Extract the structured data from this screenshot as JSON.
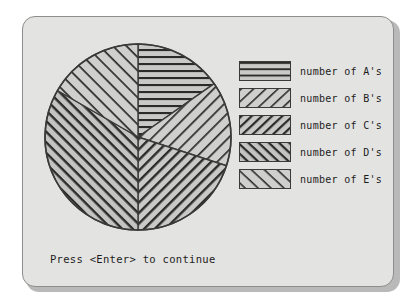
{
  "panel": {
    "background_color": "#e3e3e1",
    "border_color": "#8d8d8d"
  },
  "prompt": {
    "text": "Press <Enter> to continue"
  },
  "legend": {
    "items": [
      {
        "label": "number of A's",
        "pattern": "horizontal-lines",
        "key": "A"
      },
      {
        "label": "number of B's",
        "pattern": "forward-diagonal-sparse",
        "key": "B"
      },
      {
        "label": "number of C's",
        "pattern": "forward-diagonal-dense",
        "key": "C"
      },
      {
        "label": "number of D's",
        "pattern": "back-diagonal-dense",
        "key": "D"
      },
      {
        "label": "number of E's",
        "pattern": "back-diagonal-sparse",
        "key": "E"
      }
    ]
  },
  "chart_data": {
    "type": "pie",
    "title": "",
    "start_angle_deg": 0,
    "direction": "clockwise",
    "center": {
      "x": 95,
      "y": 95
    },
    "radius": 93,
    "categories": [
      "number of A's",
      "number of B's",
      "number of C's",
      "number of D's",
      "number of E's"
    ],
    "labels": [
      "A",
      "B",
      "C",
      "D",
      "E"
    ],
    "values": [
      15.3,
      14.7,
      20.0,
      33.3,
      16.7
    ],
    "units": "percent",
    "slices": [
      {
        "label": "number of A's",
        "value": 15.3,
        "start_deg": 0,
        "end_deg": 55,
        "pattern": "horizontal-lines",
        "fill": "#c9c9c7"
      },
      {
        "label": "number of B's",
        "value": 14.7,
        "start_deg": 55,
        "end_deg": 108,
        "pattern": "forward-diagonal-sparse",
        "fill": "#cfcfcd"
      },
      {
        "label": "number of C's",
        "value": 20.0,
        "start_deg": 108,
        "end_deg": 180,
        "pattern": "forward-diagonal-dense",
        "fill": "#c9c9c7"
      },
      {
        "label": "number of D's",
        "value": 33.3,
        "start_deg": 180,
        "end_deg": 300,
        "pattern": "back-diagonal-dense",
        "fill": "#c4c4c2"
      },
      {
        "label": "number of E's",
        "value": 16.7,
        "start_deg": 300,
        "end_deg": 360,
        "pattern": "back-diagonal-sparse",
        "fill": "#cfcfcd"
      }
    ],
    "legend_position": "right",
    "grid": false,
    "outline_color": "#3a3a3a"
  }
}
